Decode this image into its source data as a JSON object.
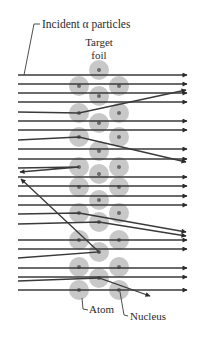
{
  "labels": {
    "incident": "Incident α particles",
    "target_line1": "Target",
    "target_line2": "foil",
    "atom": "Atom",
    "nucleus": "Nucleus"
  },
  "colors": {
    "background": "#ffffff",
    "line": "#3a3a3a",
    "atom": "#c8c8c8",
    "nucleus": "#6a6a6a",
    "text": "#2a2a2a"
  },
  "geometry": {
    "beam_start_x": 18,
    "beam_end_x": 187,
    "atom_radius": 10,
    "nucleus_radius": 2
  },
  "atoms": [
    [
      99,
      70
    ],
    [
      79,
      86
    ],
    [
      119,
      86
    ],
    [
      99,
      96
    ],
    [
      79,
      113
    ],
    [
      119,
      113
    ],
    [
      99,
      123
    ],
    [
      79,
      137
    ],
    [
      119,
      137
    ],
    [
      99,
      151
    ],
    [
      79,
      167
    ],
    [
      119,
      167
    ],
    [
      99,
      174
    ],
    [
      79,
      187
    ],
    [
      119,
      187
    ],
    [
      99,
      200
    ],
    [
      79,
      213
    ],
    [
      119,
      213
    ],
    [
      99,
      222
    ],
    [
      79,
      240
    ],
    [
      119,
      240
    ],
    [
      99,
      252
    ],
    [
      79,
      267
    ],
    [
      119,
      267
    ],
    [
      99,
      278
    ],
    [
      79,
      290
    ],
    [
      119,
      290
    ]
  ],
  "trajectories": [
    {
      "type": "straight",
      "y": 75
    },
    {
      "type": "straight",
      "y": 84
    },
    {
      "type": "straight",
      "y": 93
    },
    {
      "type": "straight",
      "y": 102
    },
    {
      "type": "deflected",
      "y": 112,
      "hit": [
        79,
        113
      ],
      "end": [
        186,
        90
      ]
    },
    {
      "type": "straight",
      "y": 121
    },
    {
      "type": "straight",
      "y": 130
    },
    {
      "type": "deflected",
      "y": 140,
      "hit": [
        79,
        137
      ],
      "end": [
        186,
        162
      ]
    },
    {
      "type": "straight",
      "y": 149
    },
    {
      "type": "straight",
      "y": 159
    },
    {
      "type": "backscatter",
      "y": 168,
      "hit": [
        79,
        167
      ],
      "end": [
        20,
        172
      ]
    },
    {
      "type": "straight",
      "y": 177
    },
    {
      "type": "straight",
      "y": 186
    },
    {
      "type": "straight",
      "y": 196
    },
    {
      "type": "straight",
      "y": 205
    },
    {
      "type": "deflected",
      "y": 214,
      "hit": [
        79,
        213
      ],
      "end": [
        186,
        232
      ]
    },
    {
      "type": "deflected",
      "y": 224,
      "hit": [
        99,
        222
      ],
      "end": [
        186,
        236
      ]
    },
    {
      "type": "straight",
      "y": 240
    },
    {
      "type": "straight",
      "y": 249
    },
    {
      "type": "backscatter",
      "y": 258,
      "hit": [
        99,
        252
      ],
      "end": [
        21,
        179
      ]
    },
    {
      "type": "straight",
      "y": 268
    },
    {
      "type": "straight",
      "y": 277
    },
    {
      "type": "deflected",
      "y": 281,
      "hit": [
        99,
        278
      ],
      "end": [
        150,
        296
      ]
    },
    {
      "type": "straight",
      "y": 290
    }
  ]
}
